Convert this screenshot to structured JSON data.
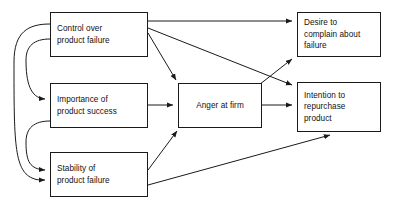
{
  "diagram": {
    "type": "path-model",
    "title": "",
    "stroke_color": "#1a1a1a",
    "background_color": "#ffffff",
    "nodes": [
      {
        "id": "control",
        "label": "Control over\nproduct failure",
        "column": "antecedent",
        "x": 50,
        "y": 12,
        "w": 98,
        "h": 45
      },
      {
        "id": "importance",
        "label": "Importance of\nproduct success",
        "column": "antecedent",
        "x": 50,
        "y": 83,
        "w": 98,
        "h": 45
      },
      {
        "id": "stability",
        "label": "Stability of\nproduct failure",
        "column": "antecedent",
        "x": 50,
        "y": 152,
        "w": 98,
        "h": 45
      },
      {
        "id": "anger",
        "label": "Anger at firm",
        "column": "mediator",
        "x": 178,
        "y": 83,
        "w": 84,
        "h": 45
      },
      {
        "id": "desire",
        "label": "Desire to\ncomplain about\nfailure",
        "column": "outcome",
        "x": 297,
        "y": 12,
        "w": 84,
        "h": 45
      },
      {
        "id": "intention",
        "label": "Intention to\nrepurchase\nproduct",
        "column": "outcome",
        "x": 297,
        "y": 82,
        "w": 84,
        "h": 50
      }
    ],
    "edges": [
      {
        "id": "control-desire",
        "from": "control",
        "to": "desire",
        "kind": "directed"
      },
      {
        "id": "control-intention",
        "from": "control",
        "to": "intention",
        "kind": "directed"
      },
      {
        "id": "control-anger",
        "from": "control",
        "to": "anger",
        "kind": "directed"
      },
      {
        "id": "importance-anger",
        "from": "importance",
        "to": "anger",
        "kind": "directed"
      },
      {
        "id": "stability-anger",
        "from": "stability",
        "to": "anger",
        "kind": "directed"
      },
      {
        "id": "stability-intention",
        "from": "stability",
        "to": "intention",
        "kind": "directed"
      },
      {
        "id": "anger-desire",
        "from": "anger",
        "to": "desire",
        "kind": "directed"
      },
      {
        "id": "anger-intention",
        "from": "anger",
        "to": "intention",
        "kind": "directed"
      },
      {
        "id": "control-importance-corr",
        "from": "control",
        "to": "importance",
        "kind": "curved"
      },
      {
        "id": "importance-stability-corr",
        "from": "importance",
        "to": "stability",
        "kind": "curved"
      },
      {
        "id": "control-stability-corr",
        "from": "control",
        "to": "stability",
        "kind": "curved"
      }
    ]
  }
}
